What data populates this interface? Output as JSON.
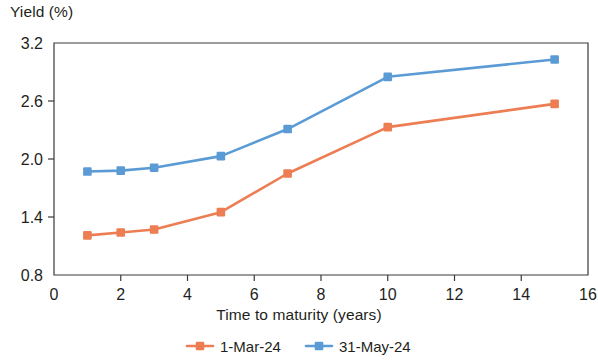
{
  "chart_data": {
    "type": "line",
    "title": "",
    "ylabel": "Yield (%)",
    "xlabel": "Time to maturity (years)",
    "x": [
      1,
      2,
      3,
      5,
      7,
      10,
      15
    ],
    "xlim": [
      0,
      16
    ],
    "ylim": [
      0.8,
      3.2
    ],
    "xticks": [
      0,
      2,
      4,
      6,
      8,
      10,
      12,
      14,
      16
    ],
    "yticks": [
      0.8,
      1.4,
      2.0,
      2.6,
      3.2
    ],
    "xtick_labels": [
      "0",
      "2",
      "4",
      "6",
      "8",
      "10",
      "12",
      "14",
      "16"
    ],
    "ytick_labels": [
      "0.8",
      "1.4",
      "2.0",
      "2.6",
      "3.2"
    ],
    "grid": false,
    "legend_position": "bottom",
    "series": [
      {
        "name": "1-Mar-24",
        "color": "#ED7D52",
        "marker": "square",
        "values": [
          1.21,
          1.24,
          1.27,
          1.45,
          1.85,
          2.33,
          2.57
        ]
      },
      {
        "name": "31-May-24",
        "color": "#5B9BD5",
        "marker": "square",
        "values": [
          1.87,
          1.88,
          1.91,
          2.03,
          2.31,
          2.85,
          3.03
        ]
      }
    ]
  },
  "axes": {
    "y_title": "Yield (%)",
    "x_title": "Time to maturity (years)"
  },
  "legend": {
    "items": [
      {
        "label": "1-Mar-24",
        "color": "#ED7D52"
      },
      {
        "label": "31-May-24",
        "color": "#5B9BD5"
      }
    ]
  },
  "colors": {
    "series_1": "#ED7D52",
    "series_2": "#5B9BD5",
    "axis": "#3a3a38",
    "text": "#231f20"
  }
}
